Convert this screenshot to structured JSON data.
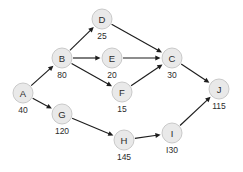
{
  "diagram": {
    "type": "directed-acyclic-graph",
    "background_color": "#ffffff",
    "node_fill_color": "#e9e9e9",
    "node_stroke_color": "#c9c9c9",
    "edge_color": "#1d1d1d",
    "text_color": "#2b2b2b",
    "node_radius": 10,
    "nodes": [
      {
        "id": "A",
        "label": "A",
        "value": "40",
        "x": 23,
        "y": 93,
        "value_x": 23,
        "value_y": 111
      },
      {
        "id": "B",
        "label": "B",
        "value": "80",
        "x": 62,
        "y": 58,
        "value_x": 62,
        "value_y": 76
      },
      {
        "id": "D",
        "label": "D",
        "value": "25",
        "x": 102,
        "y": 19,
        "value_x": 102,
        "value_y": 37
      },
      {
        "id": "E",
        "label": "E",
        "value": "20",
        "x": 112,
        "y": 58,
        "value_x": 112,
        "value_y": 76
      },
      {
        "id": "F",
        "label": "F",
        "value": "15",
        "x": 122,
        "y": 92,
        "value_x": 122,
        "value_y": 110
      },
      {
        "id": "C",
        "label": "C",
        "value": "30",
        "x": 172,
        "y": 58,
        "value_x": 172,
        "value_y": 76
      },
      {
        "id": "G",
        "label": "G",
        "value": "120",
        "x": 62,
        "y": 114,
        "value_x": 62,
        "value_y": 132
      },
      {
        "id": "H",
        "label": "H",
        "value": "145",
        "x": 124,
        "y": 140,
        "value_x": 124,
        "value_y": 158
      },
      {
        "id": "I",
        "label": "I",
        "value": "I30",
        "x": 172,
        "y": 133,
        "value_x": 172,
        "value_y": 151
      },
      {
        "id": "J",
        "label": "J",
        "value": "115",
        "x": 219,
        "y": 89,
        "value_x": 219,
        "value_y": 107
      }
    ],
    "edges": [
      {
        "from": "A",
        "to": "B"
      },
      {
        "from": "A",
        "to": "G"
      },
      {
        "from": "B",
        "to": "D"
      },
      {
        "from": "B",
        "to": "E"
      },
      {
        "from": "B",
        "to": "F"
      },
      {
        "from": "D",
        "to": "C"
      },
      {
        "from": "E",
        "to": "C"
      },
      {
        "from": "F",
        "to": "C"
      },
      {
        "from": "C",
        "to": "J"
      },
      {
        "from": "G",
        "to": "H"
      },
      {
        "from": "H",
        "to": "I"
      },
      {
        "from": "I",
        "to": "J"
      }
    ]
  }
}
